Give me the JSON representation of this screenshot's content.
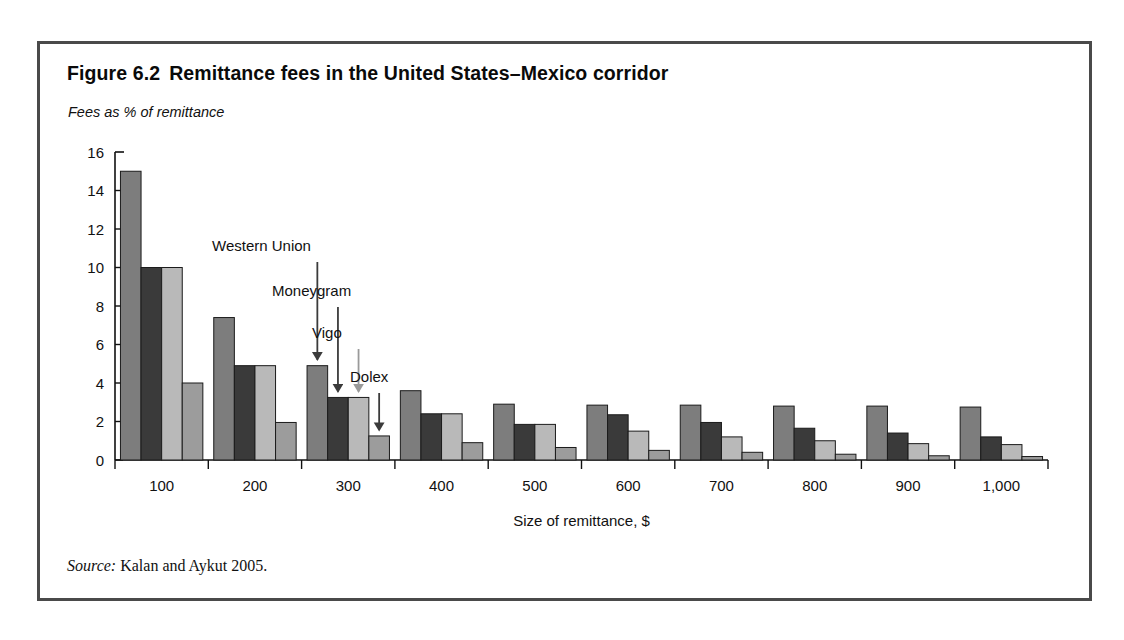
{
  "figure": {
    "number": "Figure 6.2",
    "title": "Remittance fees in the United States–Mexico corridor",
    "subtitle": "Fees as % of remittance",
    "source_label": "Source:",
    "source_text": "Kalan and Aykut 2005."
  },
  "chart_data": {
    "type": "bar",
    "title": "Remittance fees in the United States–Mexico corridor",
    "subtitle": "Fees as % of remittance",
    "xlabel": "Size of remittance, $",
    "ylabel": "Fees as % of remittance",
    "categories": [
      "100",
      "200",
      "300",
      "400",
      "500",
      "600",
      "700",
      "800",
      "900",
      "1,000"
    ],
    "ylim": [
      0,
      16
    ],
    "yticks": [
      0,
      2,
      4,
      6,
      8,
      10,
      12,
      14,
      16
    ],
    "ytick_labels": [
      "0",
      "2",
      "4",
      "6",
      "8",
      "10",
      "12",
      "14",
      "16"
    ],
    "grid": false,
    "legend": "annotated-arrows",
    "series": [
      {
        "name": "Western Union",
        "color": "#7d7d7d",
        "values": [
          15.0,
          7.4,
          4.9,
          3.6,
          2.9,
          2.85,
          2.85,
          2.8,
          2.8,
          2.75
        ]
      },
      {
        "name": "Moneygram",
        "color": "#3a3a3a",
        "values": [
          10.0,
          4.9,
          3.25,
          2.4,
          1.85,
          2.35,
          1.95,
          1.65,
          1.4,
          1.2
        ]
      },
      {
        "name": "Vigo",
        "color": "#b9b9b9",
        "values": [
          10.0,
          4.9,
          3.25,
          2.4,
          1.85,
          1.5,
          1.2,
          1.0,
          0.85,
          0.8
        ]
      },
      {
        "name": "Dolex",
        "color": "#9c9c9c",
        "values": [
          4.0,
          1.95,
          1.25,
          0.9,
          0.65,
          0.5,
          0.4,
          0.3,
          0.22,
          0.18
        ]
      }
    ],
    "annotations": [
      {
        "label": "Western Union",
        "target_group": "300",
        "target_series": "Western Union"
      },
      {
        "label": "Moneygram",
        "target_group": "300",
        "target_series": "Moneygram"
      },
      {
        "label": "Vigo",
        "target_group": "300",
        "target_series": "Vigo"
      },
      {
        "label": "Dolex",
        "target_group": "300",
        "target_series": "Dolex"
      }
    ]
  },
  "colors": {
    "frame": "#4a4a4a",
    "axis": "#111111",
    "background": "#ffffff"
  }
}
